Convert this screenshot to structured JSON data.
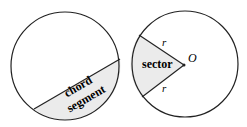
{
  "left_figure": {
    "chord_label": "chord",
    "segment_label": "segment"
  },
  "right_figure": {
    "sector_label": "sector",
    "center_label": "O",
    "radius_label_top": "r",
    "radius_label_bottom": "r"
  },
  "colors": {
    "stroke": "#222222",
    "fill": "#ebebeb"
  }
}
